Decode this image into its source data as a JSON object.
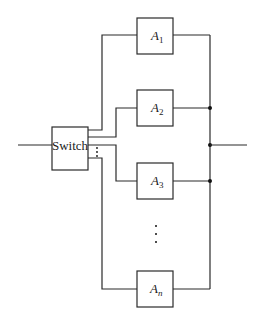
{
  "diagram": {
    "type": "parallel redundancy with switch",
    "switch": {
      "label": "Switch"
    },
    "units": [
      {
        "name": "A",
        "sub": "1"
      },
      {
        "name": "A",
        "sub": "2"
      },
      {
        "name": "A",
        "sub": "3"
      },
      {
        "name": "A",
        "sub": "n"
      }
    ],
    "ellipsis": "⋮",
    "colors": {
      "line": "#2a2a2a",
      "background": "#ffffff"
    }
  }
}
